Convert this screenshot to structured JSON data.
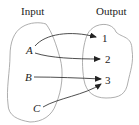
{
  "diagram": {
    "headers": {
      "input": "Input",
      "output": "Output"
    },
    "inputs": [
      "A",
      "B",
      "C"
    ],
    "outputs": [
      "1",
      "2",
      "3"
    ],
    "mappings": [
      {
        "from": "A",
        "to": "1"
      },
      {
        "from": "A",
        "to": "2"
      },
      {
        "from": "B",
        "to": "3"
      },
      {
        "from": "C",
        "to": "3"
      }
    ],
    "colors": {
      "stroke": "#999999",
      "arrow": "#222222",
      "text": "#222222"
    }
  }
}
